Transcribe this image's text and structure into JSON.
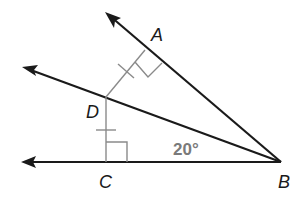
{
  "diagram": {
    "points": {
      "A": {
        "label": "A",
        "x": 145,
        "y": 50
      },
      "B": {
        "label": "B",
        "x": 281,
        "y": 162
      },
      "C": {
        "label": "C",
        "x": 106,
        "y": 162
      },
      "D": {
        "label": "D",
        "x": 106,
        "y": 97
      }
    },
    "rays": [
      {
        "name": "ray-BA",
        "from": "B",
        "through": "A"
      },
      {
        "name": "ray-BD",
        "from": "B",
        "through": "D"
      },
      {
        "name": "ray-BC",
        "from": "B",
        "through": "C"
      }
    ],
    "segments": [
      {
        "name": "segment-DA",
        "from": "D",
        "to": "A",
        "marks": "congruent-tick"
      },
      {
        "name": "segment-DC",
        "from": "D",
        "to": "C",
        "marks": "congruent-tick"
      }
    ],
    "right_angles": [
      "A",
      "C"
    ],
    "angle_label": "20°",
    "colors": {
      "rays": "#1a1a1a",
      "perpendiculars": "#8a8a8a",
      "angle_text": "#7a7a7a"
    }
  }
}
